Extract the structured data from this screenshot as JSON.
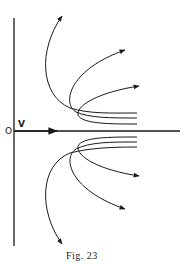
{
  "figure": {
    "caption": "Fig. 23",
    "origin_label": "O",
    "velocity_label": "V",
    "ink_color": "#1a1a1a",
    "background": "#ffffff"
  },
  "diagram": {
    "axes": [
      "vertical-axis",
      "horizontal-axis"
    ],
    "upper_trajectories": 3,
    "lower_trajectories": 3
  }
}
